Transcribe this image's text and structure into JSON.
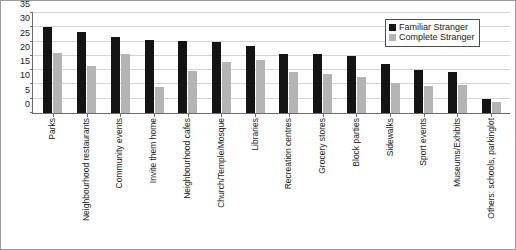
{
  "chart_data": {
    "type": "bar",
    "title": "",
    "xlabel": "",
    "ylabel": "",
    "ylim": [
      0,
      35
    ],
    "yticks": [
      0,
      5,
      10,
      15,
      20,
      25,
      30,
      35
    ],
    "grid": true,
    "legend_position": "top-right",
    "colors": {
      "familiar_stranger": "#141414",
      "complete_stranger": "#b4b4b4",
      "gridline": "#d3d3d3",
      "axis": "#6b6b6b",
      "frame": "#9a9a9a"
    },
    "categories": [
      "Parks",
      "Neighbourhood restaurants",
      "Community events",
      "Invite them home",
      "Neighbourhood cafes",
      "Church/Temple/Mosque",
      "Libraries",
      "Recreation centres",
      "Grocery stores",
      "Block parties",
      "Sidewalks",
      "Sport events",
      "Museums/Exhibits",
      "Others: schools, parkinglot"
    ],
    "series": [
      {
        "name": "Familiar Stranger",
        "values": [
          30,
          28.5,
          26.5,
          25.5,
          25.3,
          24.7,
          23.5,
          20.5,
          20.5,
          20,
          17,
          15.2,
          14.2,
          5
        ]
      },
      {
        "name": "Complete Stranger",
        "values": [
          21,
          16.5,
          20.5,
          9,
          14.7,
          18,
          18.7,
          14.2,
          13.8,
          12.7,
          10.4,
          9.5,
          9.7,
          4
        ]
      }
    ]
  },
  "legend": {
    "items": [
      {
        "label": "Familiar Stranger",
        "swatch": "familiar"
      },
      {
        "label": "Complete Stranger",
        "swatch": "complete"
      }
    ]
  }
}
